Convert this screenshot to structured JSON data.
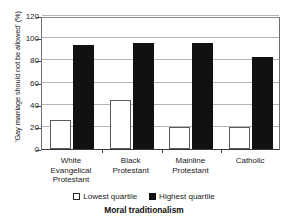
{
  "chart_data": {
    "type": "bar",
    "title": "",
    "xlabel": "Moral traditionalism",
    "ylabel": "'Gay marriage should not be allowed' (%)",
    "categories": [
      "White Evangelical Protestant",
      "Black Protestant",
      "Mainline Protestant",
      "Catholic"
    ],
    "series": [
      {
        "name": "Lowest quartile",
        "values": [
          26,
          44,
          20,
          20
        ],
        "color": "#ffffff"
      },
      {
        "name": "Highest quartile",
        "values": [
          94,
          96,
          96,
          83
        ],
        "color": "#111111"
      }
    ],
    "ylim": [
      0,
      120
    ],
    "yticks": [
      0,
      20,
      40,
      60,
      80,
      100,
      120
    ],
    "ytick_labels": [
      "0",
      "20",
      "40",
      "60",
      "80",
      "100",
      "120"
    ],
    "grid": true,
    "legend_position": "bottom"
  },
  "axis": {
    "y_title": "'Gay marriage should not be allowed' (%)",
    "x_title": "Moral traditionalism"
  },
  "categories": [
    {
      "line1": "White",
      "line2": "Evangelical",
      "line3": "Protestant"
    },
    {
      "line1": "Black",
      "line2": "Protestant",
      "line3": ""
    },
    {
      "line1": "Mainline",
      "line2": "Protestant",
      "line3": ""
    },
    {
      "line1": "Catholic",
      "line2": "",
      "line3": ""
    }
  ],
  "legend": {
    "items": [
      {
        "label": "Lowest quartile",
        "swatch": "white-square-icon"
      },
      {
        "label": "Highest quartile",
        "swatch": "black-square-icon"
      }
    ]
  }
}
